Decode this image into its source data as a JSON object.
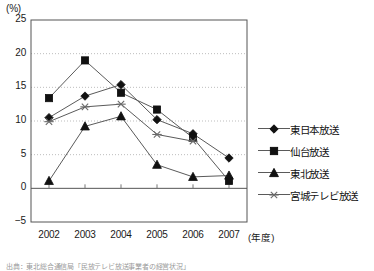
{
  "chart_data": {
    "type": "line",
    "title": "",
    "xlabel": "(年度)",
    "ylabel": "(%)",
    "x": [
      "2002",
      "2003",
      "2004",
      "2005",
      "2006",
      "2007"
    ],
    "categories": [
      "2002",
      "2003",
      "2004",
      "2005",
      "2006",
      "2007"
    ],
    "ylim": [
      -5,
      25
    ],
    "yticks": [
      -5,
      0,
      5,
      10,
      15,
      20,
      25
    ],
    "ytick_labels": [
      "-5",
      "0",
      "5",
      "10",
      "15",
      "20",
      "25"
    ],
    "grid": true,
    "legend_position": "right",
    "series": [
      {
        "name": "東日本放送",
        "marker": "diamond",
        "values": [
          10.5,
          13.7,
          15.4,
          10.2,
          8.1,
          4.5
        ]
      },
      {
        "name": "仙台放送",
        "marker": "square",
        "values": [
          13.4,
          19.0,
          14.2,
          11.7,
          7.5,
          1.1
        ]
      },
      {
        "name": "東北放送",
        "marker": "triangle",
        "values": [
          1.1,
          9.2,
          10.7,
          3.5,
          1.7,
          1.9
        ]
      },
      {
        "name": "宮城テレビ放送",
        "marker": "cross",
        "values": [
          9.9,
          12.1,
          12.5,
          8.0,
          7.0,
          null
        ]
      }
    ]
  },
  "axis": {
    "unit_label": "(%)",
    "x_title": "(年度)",
    "ytick_labels": [
      "25",
      "20",
      "15",
      "10",
      "5",
      "0",
      "-5"
    ],
    "xtick_labels": [
      "2002",
      "2003",
      "2004",
      "2005",
      "2006",
      "2007"
    ]
  },
  "legend": {
    "items": [
      {
        "label": "東日本放送",
        "marker": "diamond-marker-icon"
      },
      {
        "label": "仙台放送",
        "marker": "square-marker-icon"
      },
      {
        "label": "東北放送",
        "marker": "triangle-marker-icon"
      },
      {
        "label": "宮城テレビ放送",
        "marker": "cross-marker-icon"
      }
    ]
  },
  "footnote": {
    "text": "出典：東北総合通信局「民放テレビ放送事業者の経営状況」"
  },
  "colors": {
    "line": "#5a5a5a",
    "marker": "#111111",
    "grid": "#bdbdbd",
    "frame": "#555555",
    "axis_zero": "#555555"
  }
}
